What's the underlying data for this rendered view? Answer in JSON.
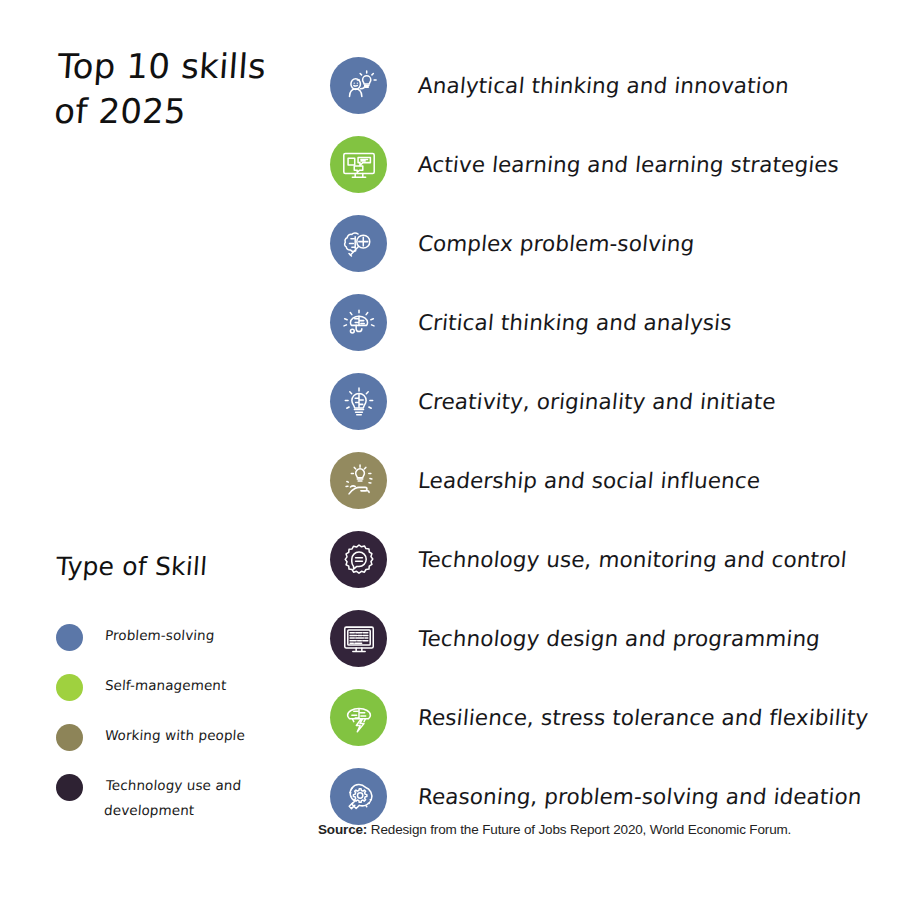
{
  "title": "Top 10 skills\nof 2025",
  "legend": {
    "title": "Type of Skill",
    "items": [
      {
        "label": "Problem-solving",
        "color": "#5b77a8",
        "swatch": "problem-solving-swatch"
      },
      {
        "label": "Self-management",
        "color": "#9fd13f",
        "swatch": "self-management-swatch"
      },
      {
        "label": "Working with people",
        "color": "#8d8458",
        "swatch": "working-with-people-swatch"
      },
      {
        "label": "Technology use and development",
        "color": "#2e2233",
        "swatch": "technology-use-swatch"
      }
    ]
  },
  "skills": [
    {
      "rank": 1,
      "label": "Analytical thinking and innovation",
      "color": "#5b77a8",
      "type": "Problem-solving",
      "icon": "head-lightbulb-icon"
    },
    {
      "rank": 2,
      "label": "Active learning and learning strategies",
      "color": "#82c341",
      "type": "Self-management",
      "icon": "monitor-chat-icon"
    },
    {
      "rank": 3,
      "label": "Complex problem-solving",
      "color": "#5b77a8",
      "type": "Problem-solving",
      "icon": "brain-magnifier-icon"
    },
    {
      "rank": 4,
      "label": "Critical thinking and analysis",
      "color": "#5b77a8",
      "type": "Problem-solving",
      "icon": "brain-rays-icon"
    },
    {
      "rank": 5,
      "label": "Creativity, originality and initiate",
      "color": "#5b77a8",
      "type": "Problem-solving",
      "icon": "lightbulb-brain-icon"
    },
    {
      "rank": 6,
      "label": "Leadership and social influence",
      "color": "#938a5f",
      "type": "Working with people",
      "icon": "hand-lightbulb-icon"
    },
    {
      "rank": 7,
      "label": "Technology use, monitoring and control",
      "color": "#33243a",
      "type": "Technology use and development",
      "icon": "gear-speech-icon"
    },
    {
      "rank": 8,
      "label": "Technology design and programming",
      "color": "#33243a",
      "type": "Technology use and development",
      "icon": "monitor-code-icon"
    },
    {
      "rank": 9,
      "label": "Resilience, stress tolerance and flexibility",
      "color": "#82c341",
      "type": "Self-management",
      "icon": "brain-bolt-icon"
    },
    {
      "rank": 10,
      "label": "Reasoning, problem-solving and ideation",
      "color": "#5b77a8",
      "type": "Problem-solving",
      "icon": "lightbulb-gear-icon"
    }
  ],
  "source": {
    "label": "Source:",
    "text": " Redesign from the Future of Jobs Report 2020, World Economic Forum."
  }
}
